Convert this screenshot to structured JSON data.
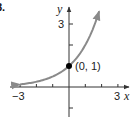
{
  "problem_label": "8.",
  "chart_data": {
    "type": "line",
    "title": "",
    "function": "y = 2^x",
    "xlabel": "x",
    "ylabel": "y",
    "xlim": [
      -3.5,
      3.6
    ],
    "ylim": [
      -1.4,
      4.1
    ],
    "x_ticks": [
      -3,
      -2,
      -1,
      1,
      2,
      3
    ],
    "y_ticks": [
      -1,
      2,
      3
    ],
    "x_tick_labels": {
      "-3": "-3",
      "3": "3"
    },
    "y_tick_labels": {
      "3": "3"
    },
    "series": [
      {
        "name": "exponential curve",
        "x": [
          -3,
          -2.5,
          -2,
          -1.5,
          -1,
          -0.5,
          0,
          0.5,
          1,
          1.5,
          1.85
        ],
        "y": [
          0.125,
          0.177,
          0.25,
          0.354,
          0.5,
          0.707,
          1,
          1.414,
          2,
          2.828,
          3.6
        ],
        "color": "#8a8a8a",
        "arrows": "both"
      }
    ],
    "annotations": [
      {
        "x": 0,
        "y": 1,
        "text": "(0, 1)",
        "marker": "filled-dot"
      }
    ],
    "grid": false,
    "legend": null
  },
  "labels": {
    "y_axis": "y",
    "x_axis": "x",
    "y_tick_3": "3",
    "x_tick_neg3": "−3",
    "x_tick_3": "3",
    "point": "(0, 1)"
  },
  "colors": {
    "axis": "#333333",
    "curve": "#8a8a8a",
    "point": "#000000"
  }
}
